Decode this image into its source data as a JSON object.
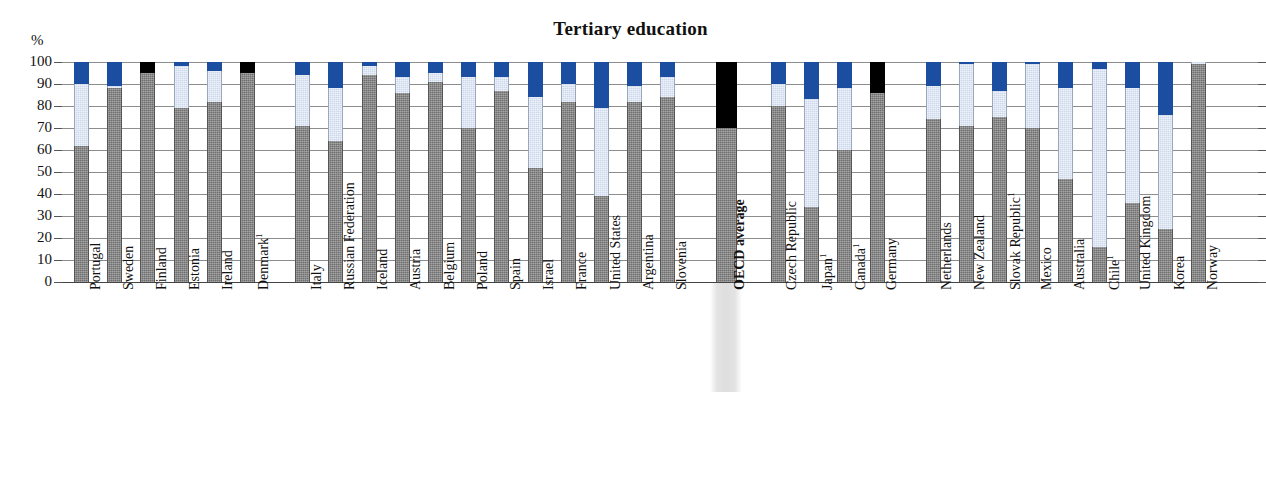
{
  "chart_data": {
    "type": "bar",
    "subtype": "stacked-bar",
    "title": "Tertiary education",
    "ylabel": "%",
    "xlabel": "",
    "ylim": [
      0,
      100
    ],
    "yticks": [
      0,
      10,
      20,
      30,
      40,
      50,
      60,
      70,
      80,
      90,
      100
    ],
    "grid": true,
    "legend_position": "none",
    "series": [
      {
        "name": "dark-gray",
        "color": "#6f6f6f"
      },
      {
        "name": "light-blue",
        "color": "#ccd8ec"
      },
      {
        "name": "dark-blue",
        "color": "#1b4da1"
      },
      {
        "name": "black",
        "color": "#000000"
      }
    ],
    "categories": [
      "Portugal",
      "Sweden",
      "Finland",
      "Estonia",
      "Ireland",
      "Denmark¹",
      "Italy",
      "Russian Federation",
      "Iceland",
      "Austria",
      "Belgium",
      "Poland",
      "Spain",
      "Israel",
      "France",
      "United States",
      "Argentina",
      "Slovenia",
      "OECD average",
      "Czech Republic",
      "Japan¹",
      "Canada¹",
      "Germany",
      "Netherlands",
      "New Zealand",
      "Slovak Republic¹",
      "Mexico",
      "Australia",
      "Chile¹",
      "United Kingdom",
      "Korea",
      "Norway"
    ],
    "bars": [
      {
        "label": "Portugal",
        "group": 0,
        "gray": 62,
        "light": 28,
        "blue": 10,
        "black": 0
      },
      {
        "label": "Sweden",
        "group": 0,
        "gray": 88,
        "light": 1,
        "blue": 11,
        "black": 0
      },
      {
        "label": "Finland",
        "group": 0,
        "gray": 95,
        "light": 0,
        "blue": 0,
        "black": 5
      },
      {
        "label": "Estonia",
        "group": 0,
        "gray": 79,
        "light": 19,
        "blue": 2,
        "black": 0
      },
      {
        "label": "Ireland",
        "group": 0,
        "gray": 82,
        "light": 14,
        "blue": 4,
        "black": 0
      },
      {
        "label": "Denmark¹",
        "group": 0,
        "gray": 95,
        "light": 0,
        "blue": 0,
        "black": 5
      },
      {
        "label": "Italy",
        "group": 1,
        "gray": 71,
        "light": 23,
        "blue": 6,
        "black": 0
      },
      {
        "label": "Russian Federation",
        "group": 1,
        "gray": 64,
        "light": 24,
        "blue": 12,
        "black": 0
      },
      {
        "label": "Iceland",
        "group": 1,
        "gray": 94,
        "light": 4,
        "blue": 2,
        "black": 0
      },
      {
        "label": "Austria",
        "group": 1,
        "gray": 86,
        "light": 7,
        "blue": 7,
        "black": 0
      },
      {
        "label": "Belgium",
        "group": 1,
        "gray": 91,
        "light": 4,
        "blue": 5,
        "black": 0
      },
      {
        "label": "Poland",
        "group": 1,
        "gray": 70,
        "light": 23,
        "blue": 7,
        "black": 0
      },
      {
        "label": "Spain",
        "group": 1,
        "gray": 87,
        "light": 6,
        "blue": 7,
        "black": 0
      },
      {
        "label": "Israel",
        "group": 1,
        "gray": 52,
        "light": 32,
        "blue": 16,
        "black": 0
      },
      {
        "label": "France",
        "group": 1,
        "gray": 82,
        "light": 8,
        "blue": 10,
        "black": 0
      },
      {
        "label": "United States",
        "group": 1,
        "gray": 39,
        "light": 40,
        "blue": 21,
        "black": 0
      },
      {
        "label": "Argentina",
        "group": 1,
        "gray": 82,
        "light": 7,
        "blue": 11,
        "black": 0
      },
      {
        "label": "Slovenia",
        "group": 1,
        "gray": 84,
        "light": 9,
        "blue": 7,
        "black": 0
      },
      {
        "label": "OECD average",
        "group": 2,
        "gray": 70,
        "light": 0,
        "blue": 0,
        "black": 30,
        "highlight": true
      },
      {
        "label": "Czech Republic",
        "group": 3,
        "gray": 80,
        "light": 10,
        "blue": 10,
        "black": 0
      },
      {
        "label": "Japan¹",
        "group": 3,
        "gray": 34,
        "light": 49,
        "blue": 17,
        "black": 0
      },
      {
        "label": "Canada¹",
        "group": 3,
        "gray": 60,
        "light": 28,
        "blue": 12,
        "black": 0
      },
      {
        "label": "Germany",
        "group": 3,
        "gray": 86,
        "light": 0,
        "blue": 0,
        "black": 14
      },
      {
        "label": "Netherlands",
        "group": 4,
        "gray": 74,
        "light": 15,
        "blue": 11,
        "black": 0
      },
      {
        "label": "New Zealand",
        "group": 4,
        "gray": 71,
        "light": 28,
        "blue": 1,
        "black": 0
      },
      {
        "label": "Slovak Republic¹",
        "group": 4,
        "gray": 75,
        "light": 12,
        "blue": 13,
        "black": 0
      },
      {
        "label": "Mexico",
        "group": 4,
        "gray": 70,
        "light": 29,
        "blue": 1,
        "black": 0
      },
      {
        "label": "Australia",
        "group": 4,
        "gray": 47,
        "light": 41,
        "blue": 12,
        "black": 0
      },
      {
        "label": "Chile¹",
        "group": 4,
        "gray": 16,
        "light": 81,
        "blue": 3,
        "black": 0
      },
      {
        "label": "United Kingdom",
        "group": 4,
        "gray": 36,
        "light": 52,
        "blue": 12,
        "black": 0
      },
      {
        "label": "Korea",
        "group": 4,
        "gray": 24,
        "light": 52,
        "blue": 24,
        "black": 0
      },
      {
        "label": "Norway",
        "group": 4,
        "gray": 99,
        "light": 1,
        "blue": 0,
        "black": 0
      }
    ]
  },
  "colors": {
    "dark_blue": "#1b4da1",
    "light_blue": "#ccd8ec",
    "gray": "#6f6f6f",
    "black": "#000000",
    "gridline": "#8d8d8d",
    "highlight_band": "#dedede"
  }
}
